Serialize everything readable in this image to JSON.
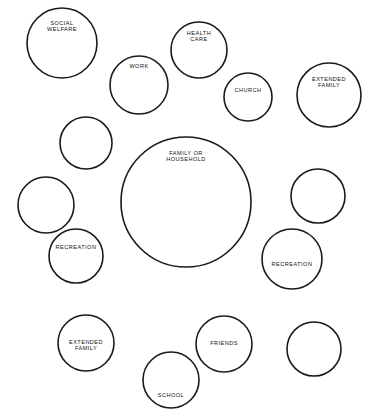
{
  "diagram": {
    "type": "circle-cluster",
    "background_color": "#ffffff",
    "stroke_color": "#1a1a1a",
    "label_color": "#111111",
    "canvas": {
      "width": 380,
      "height": 412
    },
    "nodes": [
      {
        "id": "social-welfare",
        "label_lines": [
          "SOCIAL",
          "WELFARE"
        ],
        "cx": 62,
        "cy": 43,
        "r": 35,
        "label_dy": -16,
        "labeled": true
      },
      {
        "id": "work",
        "label_lines": [
          "WORK"
        ],
        "cx": 139,
        "cy": 85,
        "r": 29,
        "label_dy": -18,
        "labeled": true
      },
      {
        "id": "health-care",
        "label_lines": [
          "HEALTH",
          "CARE"
        ],
        "cx": 199,
        "cy": 50,
        "r": 28,
        "label_dy": -13,
        "labeled": true
      },
      {
        "id": "church",
        "label_lines": [
          "CHURCH"
        ],
        "cx": 248,
        "cy": 97,
        "r": 24,
        "label_dy": -6,
        "labeled": true
      },
      {
        "id": "extended-family-top",
        "label_lines": [
          "EXTENDED",
          "FAMILY"
        ],
        "cx": 329,
        "cy": 95,
        "r": 32,
        "label_dy": -12,
        "labeled": true
      },
      {
        "id": "unlabeled-upper-left",
        "label_lines": [],
        "cx": 86,
        "cy": 143,
        "r": 26,
        "label_dy": 0,
        "labeled": false
      },
      {
        "id": "family-or-household",
        "label_lines": [
          "FAMILY OR",
          "HOUSEHOLD"
        ],
        "cx": 186,
        "cy": 202,
        "r": 65,
        "label_dy": -45,
        "labeled": true
      },
      {
        "id": "unlabeled-left-middle",
        "label_lines": [],
        "cx": 46,
        "cy": 205,
        "r": 28,
        "label_dy": 0,
        "labeled": false
      },
      {
        "id": "unlabeled-right-middle",
        "label_lines": [],
        "cx": 318,
        "cy": 196,
        "r": 27,
        "label_dy": 0,
        "labeled": false
      },
      {
        "id": "recreation-left",
        "label_lines": [
          "RECREATION"
        ],
        "cx": 76,
        "cy": 256,
        "r": 27,
        "label_dy": -8,
        "labeled": true
      },
      {
        "id": "recreation-right",
        "label_lines": [
          "RECREATION"
        ],
        "cx": 292,
        "cy": 259,
        "r": 30,
        "label_dy": 6,
        "labeled": true
      },
      {
        "id": "extended-family-bottom",
        "label_lines": [
          "EXTENDED",
          "FAMILY"
        ],
        "cx": 86,
        "cy": 343,
        "r": 28,
        "label_dy": 3,
        "labeled": true
      },
      {
        "id": "friends",
        "label_lines": [
          "FRIENDS"
        ],
        "cx": 224,
        "cy": 344,
        "r": 28,
        "label_dy": 0,
        "labeled": true
      },
      {
        "id": "school",
        "label_lines": [
          "SCHOOL"
        ],
        "cx": 171,
        "cy": 380,
        "r": 28,
        "label_dy": 16,
        "labeled": true
      },
      {
        "id": "unlabeled-bottom-right",
        "label_lines": [],
        "cx": 314,
        "cy": 349,
        "r": 27,
        "label_dy": 0,
        "labeled": false
      }
    ]
  }
}
